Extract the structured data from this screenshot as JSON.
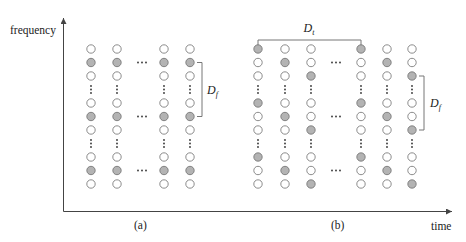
{
  "axes": {
    "y_label": "frequency",
    "x_label": "time"
  },
  "panels": [
    {
      "caption": "(a)",
      "bracket_label": "D",
      "bracket_sub": "f",
      "columns_x": [
        91,
        117,
        164,
        190
      ],
      "ellipsis_x": 142,
      "rows": [
        {
          "type": "circles",
          "fill": [
            0,
            0,
            0,
            0
          ]
        },
        {
          "type": "circles",
          "fill": [
            1,
            1,
            1,
            1
          ],
          "ellipsis": true
        },
        {
          "type": "circles",
          "fill": [
            0,
            0,
            0,
            0
          ]
        },
        {
          "type": "vdots"
        },
        {
          "type": "circles",
          "fill": [
            0,
            0,
            0,
            0
          ]
        },
        {
          "type": "circles",
          "fill": [
            1,
            1,
            1,
            1
          ],
          "ellipsis": true
        },
        {
          "type": "circles",
          "fill": [
            0,
            0,
            0,
            0
          ]
        },
        {
          "type": "vdots"
        },
        {
          "type": "circles",
          "fill": [
            0,
            0,
            0,
            0
          ]
        },
        {
          "type": "circles",
          "fill": [
            1,
            1,
            1,
            1
          ],
          "ellipsis": true
        },
        {
          "type": "circles",
          "fill": [
            0,
            0,
            0,
            0
          ]
        }
      ],
      "df_bracket": {
        "x": 202,
        "row_from": 1,
        "row_to": 5,
        "label_x": 207
      }
    },
    {
      "caption": "(b)",
      "bracket_label": "D",
      "bracket_sub": "f",
      "top_bracket_label": "D",
      "top_bracket_sub": "t",
      "columns_x": [
        258,
        285,
        311,
        361,
        387,
        412
      ],
      "ellipsis_x": 336,
      "rows": [
        {
          "type": "circles",
          "fill": [
            1,
            0,
            0,
            1,
            0,
            0
          ]
        },
        {
          "type": "circles",
          "fill": [
            0,
            1,
            0,
            0,
            1,
            0
          ],
          "ellipsis": true
        },
        {
          "type": "circles",
          "fill": [
            0,
            0,
            1,
            0,
            0,
            1
          ]
        },
        {
          "type": "vdots"
        },
        {
          "type": "circles",
          "fill": [
            1,
            0,
            0,
            1,
            0,
            0
          ]
        },
        {
          "type": "circles",
          "fill": [
            0,
            1,
            0,
            0,
            1,
            0
          ],
          "ellipsis": true
        },
        {
          "type": "circles",
          "fill": [
            0,
            0,
            1,
            0,
            0,
            1
          ]
        },
        {
          "type": "vdots"
        },
        {
          "type": "circles",
          "fill": [
            1,
            0,
            0,
            1,
            0,
            0
          ]
        },
        {
          "type": "circles",
          "fill": [
            0,
            1,
            0,
            0,
            1,
            0
          ],
          "ellipsis": true
        },
        {
          "type": "circles",
          "fill": [
            0,
            0,
            1,
            0,
            0,
            1
          ]
        }
      ],
      "df_bracket": {
        "x": 424,
        "row_from": 2,
        "row_to": 6,
        "label_x": 430
      },
      "dt_bracket": {
        "x1": 258,
        "x2": 361,
        "y": 40
      }
    }
  ],
  "layout": {
    "row_y": [
      49,
      62.5,
      76,
      89.5,
      103,
      116.5,
      130,
      143.5,
      157,
      170.5,
      184
    ],
    "caption_y": 229,
    "radius": 4.2
  },
  "colors": {
    "filled": "#b3b3b3",
    "stroke": "#6e6e6e",
    "axis": "#444444",
    "bracket": "#777777"
  }
}
